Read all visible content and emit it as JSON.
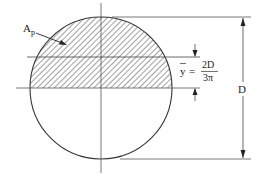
{
  "diagram": {
    "labels": {
      "area": "A",
      "area_subscript": "p",
      "ybar": "y",
      "equals": "=",
      "numerator": "2D",
      "denominator": "3π",
      "diameter": "D"
    },
    "colors": {
      "stroke": "#333333",
      "hatch": "#444444",
      "background": "#ffffff"
    }
  }
}
